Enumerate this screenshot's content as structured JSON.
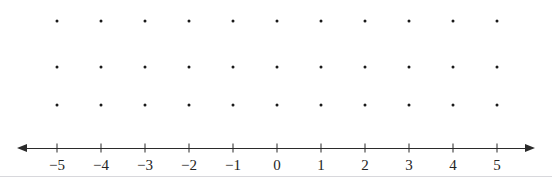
{
  "figure": {
    "name": "number-line-with-dot-grid",
    "width": 552,
    "height": 185,
    "background_color": "#ffffff"
  },
  "chart_data": {
    "type": "scatter",
    "title": "",
    "xlabel": "",
    "ylabel": "",
    "grid": true,
    "legend": null,
    "x": [
      -5,
      -4,
      -3,
      -2,
      -1,
      0,
      1,
      2,
      3,
      4,
      5
    ],
    "xlim": [
      -5.45,
      5.45
    ],
    "dot_grid": {
      "columns": [
        -5,
        -4,
        -3,
        -2,
        -1,
        0,
        1,
        2,
        3,
        4,
        5
      ],
      "rows": [
        3,
        2,
        1
      ],
      "row_count": 3,
      "column_count": 11,
      "total_dots": 33,
      "dot_color": "#1a1a1a",
      "dot_radius_px": 1.5
    }
  },
  "number_line": {
    "axis_color": "#2b2b2b",
    "tick_labels": [
      "−5",
      "−4",
      "−3",
      "−2",
      "−1",
      "0",
      "1",
      "2",
      "3",
      "4",
      "5"
    ],
    "tick_values": [
      -5,
      -4,
      -3,
      -2,
      -1,
      0,
      1,
      2,
      3,
      4,
      5
    ],
    "left_arrow": "arrow-left",
    "right_arrow": "arrow-right",
    "axis_y_px": 148,
    "first_tick_x_px": 57,
    "tick_spacing_px": 44,
    "line_start_x_px": 27,
    "line_end_x_px": 525
  },
  "bottom_rule": {
    "color": "#d8d8dc",
    "y_px": 176
  }
}
